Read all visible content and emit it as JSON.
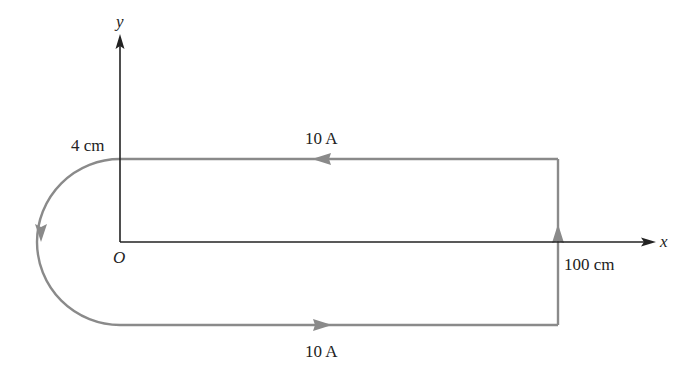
{
  "figure": {
    "axes": {
      "x_label": "x",
      "y_label": "y",
      "origin_label": "O",
      "axis_color": "#222222"
    },
    "loop": {
      "wire_color": "#8a8a8a",
      "top_current_label": "10 A",
      "bottom_current_label": "10 A",
      "radius_label": "4 cm",
      "length_label": "100 cm",
      "current_direction": "counterclockwise: right along bottom, up right side, left along top, down around semicircle"
    }
  }
}
